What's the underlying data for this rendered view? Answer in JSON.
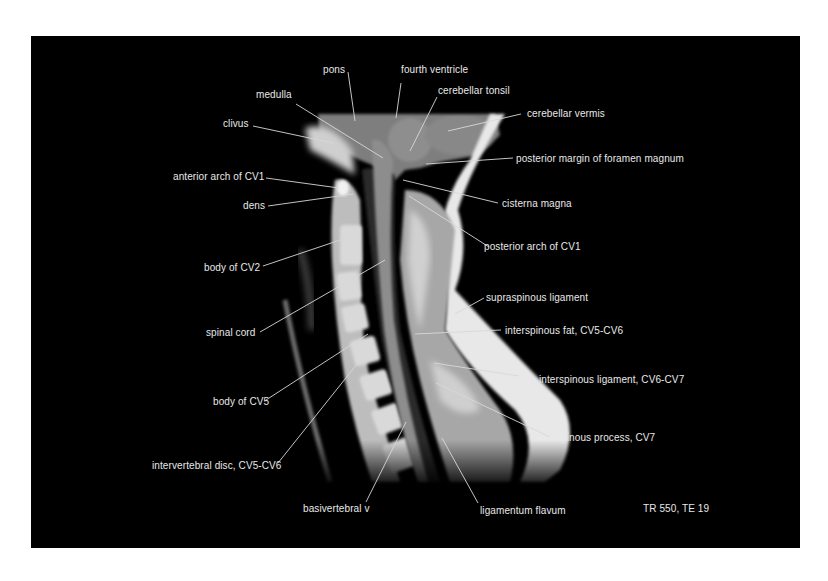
{
  "figure": {
    "sequence": "TR 550, TE 19",
    "colors": {
      "background": "#ffffff",
      "panel": "#000000",
      "label": "#e8e8e8",
      "leader": "#d8d8d8"
    }
  },
  "labels": {
    "pons": "pons",
    "fourth_ventricle": "fourth ventricle",
    "medulla": "medulla",
    "cerebellar_tonsil": "cerebellar tonsil",
    "cerebellar_vermis": "cerebellar vermis",
    "clivus": "clivus",
    "posterior_margin_foramen_magnum": "posterior margin of foramen magnum",
    "anterior_arch_cv1": "anterior arch of CV1",
    "dens": "dens",
    "cisterna_magna": "cisterna magna",
    "posterior_arch_cv1": "posterior arch of CV1",
    "body_cv2": "body of CV2",
    "supraspinous_ligament": "supraspinous ligament",
    "spinal_cord": "spinal cord",
    "interspinous_fat": "interspinous fat, CV5-CV6",
    "body_cv5": "body of CV5",
    "interspinous_ligament": "interspinous ligament, CV6-CV7",
    "spinous_process_cv7": "spinous process, CV7",
    "intervertebral_disc": "intervertebral disc, CV5-CV6",
    "basivertebral_v": "basivertebral v",
    "ligamentum_flavum": "ligamentum flavum"
  }
}
